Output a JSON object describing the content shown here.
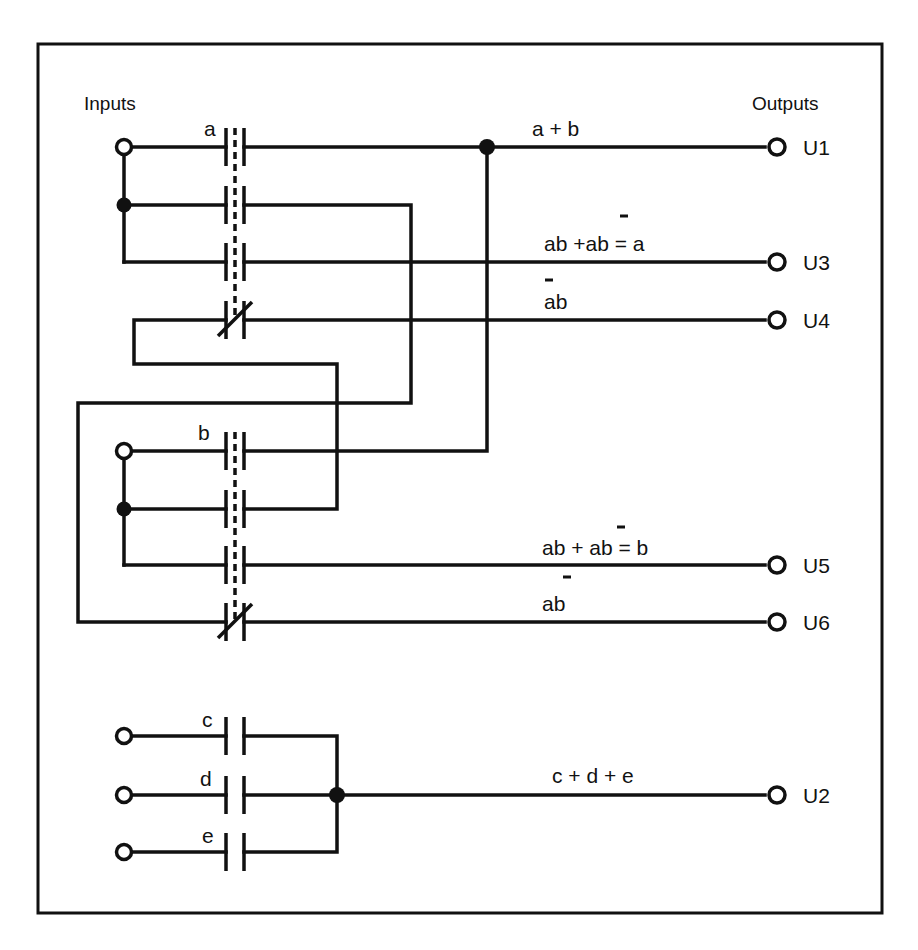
{
  "diagram": {
    "headers": {
      "inputs": "Inputs",
      "outputs": "Outputs"
    },
    "contacts": {
      "a": "a",
      "b": "b",
      "c": "c",
      "d": "d",
      "e": "e"
    },
    "outputs": [
      {
        "id": "U1",
        "label": "U1",
        "expression": "a + b"
      },
      {
        "id": "U3",
        "label": "U3",
        "expression": "ab +ab = a",
        "overbar_on": "second b"
      },
      {
        "id": "U4",
        "label": "U4",
        "expression": "ab",
        "overbar_on": "a"
      },
      {
        "id": "U5",
        "label": "U5",
        "expression": "ab + ab = b",
        "overbar_on": "second a"
      },
      {
        "id": "U6",
        "label": "U6",
        "expression": "ab",
        "overbar_on": "b"
      },
      {
        "id": "U2",
        "label": "U2",
        "expression": "c + d + e"
      }
    ],
    "expr": {
      "u1": "a + b",
      "u3_part1": "ab +a",
      "u3_bar_char": "b",
      "u3_part2": " = a",
      "u4_bar_char": "a",
      "u4_rest": "b",
      "u5_part1": "ab + ",
      "u5_bar_char": "a",
      "u5_part2": "b = b",
      "u6_char1": "a",
      "u6_bar_char": "b",
      "u2": "c + d + e"
    },
    "labels": {
      "u1": "U1",
      "u2": "U2",
      "u3": "U3",
      "u4": "U4",
      "u5": "U5",
      "u6": "U6"
    },
    "colors": {
      "ink": "#111111",
      "background": "#ffffff"
    }
  }
}
